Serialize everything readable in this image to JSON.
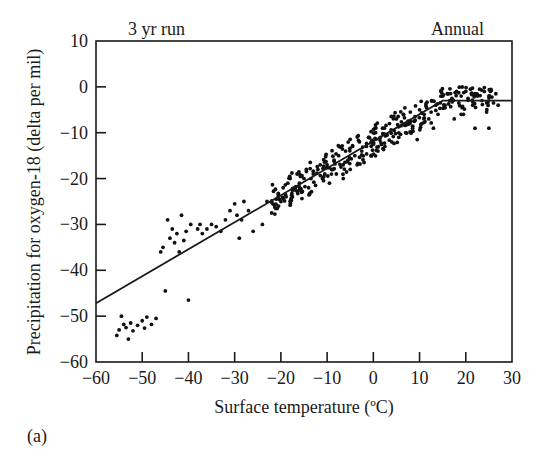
{
  "figure_label": "(a)",
  "top_left_label": "3 yr run",
  "top_right_label": "Annual",
  "chart_data": {
    "type": "scatter",
    "title": "",
    "xlabel": "Surface temperature (ºC)",
    "ylabel": "Precipitation for oxygen-18 (delta per mil)",
    "xlim": [
      -60,
      30
    ],
    "ylim": [
      -60,
      10
    ],
    "xticks": [
      -60,
      -50,
      -40,
      -30,
      -20,
      -10,
      0,
      10,
      20,
      30
    ],
    "xtick_labels": [
      "−60",
      "−50",
      "−40",
      "−30",
      "−20",
      "−10",
      "0",
      "10",
      "20",
      "30"
    ],
    "yticks": [
      10,
      0,
      -10,
      -20,
      -30,
      -40,
      -50,
      -60
    ],
    "ytick_labels": [
      "10",
      "0",
      "−10",
      "−20",
      "−30",
      "−40",
      "−50",
      "−60"
    ],
    "grid": false,
    "annotations": [
      "3 yr run",
      "Annual"
    ],
    "fit_line": {
      "points": [
        [
          -60,
          -47.2
        ],
        [
          15,
          -3.0
        ],
        [
          30,
          -3.0
        ]
      ]
    },
    "series": [
      {
        "name": "Annual means",
        "points": [
          [
            -55.5,
            -54.2
          ],
          [
            -55,
            -53
          ],
          [
            -54.5,
            -50
          ],
          [
            -54,
            -51.8
          ],
          [
            -53.5,
            -52.5
          ],
          [
            -53,
            -55
          ],
          [
            -52.5,
            -51.5
          ],
          [
            -52,
            -53.2
          ],
          [
            -51,
            -52
          ],
          [
            -50,
            -51
          ],
          [
            -49.5,
            -52.6
          ],
          [
            -49,
            -50.2
          ],
          [
            -48,
            -51.8
          ],
          [
            -47,
            -50.5
          ],
          [
            -46,
            -36
          ],
          [
            -45.5,
            -35
          ],
          [
            -45,
            -44.5
          ],
          [
            -44.5,
            -29
          ],
          [
            -44,
            -33
          ],
          [
            -43.5,
            -31
          ],
          [
            -43,
            -34
          ],
          [
            -42.5,
            -32
          ],
          [
            -42,
            -36
          ],
          [
            -41.5,
            -28
          ],
          [
            -41,
            -33.5
          ],
          [
            -40.5,
            -31.5
          ],
          [
            -40,
            -46.5
          ],
          [
            -39.5,
            -30
          ],
          [
            -38,
            -31
          ],
          [
            -37.5,
            -30
          ],
          [
            -37,
            -32
          ],
          [
            -36,
            -31
          ],
          [
            -35,
            -30
          ],
          [
            -34,
            -30.5
          ],
          [
            -33,
            -31.5
          ],
          [
            -32,
            -29
          ],
          [
            -31,
            -27
          ],
          [
            -30,
            -25.5
          ],
          [
            -29.5,
            -28
          ],
          [
            -29,
            -33
          ],
          [
            -28.5,
            -29
          ],
          [
            -28,
            -25
          ],
          [
            -27,
            -27
          ],
          [
            -26,
            -31.5
          ],
          [
            -24,
            -30
          ],
          [
            -23,
            -25
          ],
          [
            -22,
            -27.5
          ],
          [
            -21,
            -24.5
          ],
          [
            -20.5,
            -26
          ],
          [
            -20,
            -25
          ],
          [
            -19.5,
            -22
          ],
          [
            -19,
            -23.5
          ],
          [
            -18.5,
            -21
          ],
          [
            -18,
            -20
          ],
          [
            -17.5,
            -24
          ],
          [
            -17,
            -22
          ],
          [
            -16.5,
            -19
          ],
          [
            -16,
            -21
          ],
          [
            -15.5,
            -23
          ],
          [
            -15,
            -20
          ],
          [
            -14.5,
            -18
          ],
          [
            -14,
            -22
          ],
          [
            -13.5,
            -20
          ],
          [
            -13,
            -19
          ],
          [
            -12.5,
            -21.5
          ],
          [
            -12,
            -18
          ],
          [
            -11.5,
            -17
          ],
          [
            -11,
            -20
          ],
          [
            -10.5,
            -19
          ],
          [
            -10,
            -17
          ],
          [
            -9.5,
            -21
          ],
          [
            -9,
            -18
          ],
          [
            -8.5,
            -16
          ],
          [
            -8,
            -19
          ],
          [
            -7.5,
            -15
          ],
          [
            -7,
            -17.5
          ],
          [
            -6.5,
            -20
          ],
          [
            -6,
            -14
          ],
          [
            -5.5,
            -16
          ],
          [
            -5,
            -18
          ],
          [
            -4.5,
            -13
          ],
          [
            -4,
            -15
          ],
          [
            -3.5,
            -17
          ],
          [
            -3,
            -12
          ],
          [
            -2.5,
            -14
          ],
          [
            -2,
            -16.5
          ],
          [
            -1.5,
            -13
          ],
          [
            -1,
            -11
          ],
          [
            -0.5,
            -15
          ],
          [
            0,
            -12.5
          ],
          [
            0.5,
            -10
          ],
          [
            1,
            -14
          ],
          [
            1.5,
            -11
          ],
          [
            2,
            -9
          ],
          [
            2.5,
            -13
          ],
          [
            3,
            -10.5
          ],
          [
            3.5,
            -8
          ],
          [
            4,
            -12
          ],
          [
            4.5,
            -9.5
          ],
          [
            5,
            -7
          ],
          [
            5.5,
            -11
          ],
          [
            6,
            -8.5
          ],
          [
            6.5,
            -6
          ],
          [
            7,
            -10
          ],
          [
            7.5,
            -7.5
          ],
          [
            8,
            -5.5
          ],
          [
            8.5,
            -9
          ],
          [
            9,
            -6.5
          ],
          [
            9.5,
            -11.5
          ],
          [
            10,
            -5
          ],
          [
            10.5,
            -8
          ],
          [
            11,
            -6
          ],
          [
            11.5,
            -4.5
          ],
          [
            12,
            -7
          ],
          [
            12.5,
            -5.5
          ],
          [
            13,
            -9
          ],
          [
            13.5,
            -4
          ],
          [
            14,
            -6
          ],
          [
            14.5,
            -3.5
          ],
          [
            15,
            -2
          ],
          [
            15.5,
            -4
          ],
          [
            16,
            -1.5
          ],
          [
            16.5,
            -3
          ],
          [
            17,
            -2.5
          ],
          [
            17.5,
            -7
          ],
          [
            18,
            -1
          ],
          [
            18.5,
            -3.5
          ],
          [
            19,
            -2
          ],
          [
            19.5,
            -6
          ],
          [
            20,
            -1
          ],
          [
            20.5,
            -2.5
          ],
          [
            21,
            -0.5
          ],
          [
            21.5,
            -4
          ],
          [
            22,
            -1.5
          ],
          [
            22.5,
            -2
          ],
          [
            23,
            -0.5
          ],
          [
            23.5,
            -3
          ],
          [
            24,
            -1
          ],
          [
            24.5,
            -5.5
          ],
          [
            25,
            -2
          ],
          [
            25.5,
            -0.8
          ],
          [
            26,
            -3.5
          ],
          [
            26.5,
            -1.5
          ],
          [
            27,
            -4
          ],
          [
            25,
            -9
          ],
          [
            22,
            -9
          ],
          [
            19,
            -6
          ]
        ]
      }
    ]
  }
}
